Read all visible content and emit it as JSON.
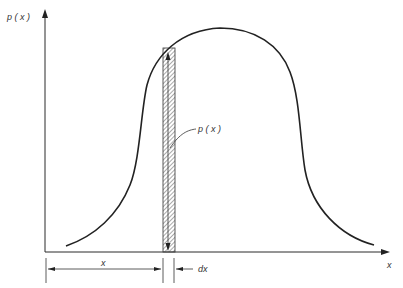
{
  "diagram": {
    "title": "",
    "labels": {
      "y_axis": "p ( x )",
      "x_axis": "x",
      "strip_height": "p ( x )",
      "position": "x",
      "width": "dx"
    },
    "colors": {
      "line": "#222222",
      "hatch": "#555555",
      "background": "#ffffff"
    }
  }
}
